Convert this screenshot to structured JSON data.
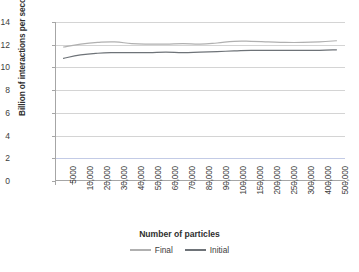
{
  "chart_data": {
    "type": "line",
    "title": "",
    "xlabel": "Number of particles",
    "ylabel": "Billion of interactions per second",
    "ylim": [
      0,
      14
    ],
    "yticks": [
      0,
      2,
      4,
      6,
      8,
      10,
      12,
      14
    ],
    "ytick_labels": [
      "0",
      "2",
      "4",
      "6",
      "8",
      "10",
      "12",
      "14"
    ],
    "grid": true,
    "legend_position": "bottom",
    "categories": [
      "5000",
      "10,000",
      "20,000",
      "30,000",
      "40,000",
      "50,000",
      "60,000",
      "70,000",
      "80,000",
      "90,000",
      "100,000",
      "150,000",
      "200,000",
      "250,000",
      "300,000",
      "400,000",
      "500,000"
    ],
    "series": [
      {
        "name": "Final",
        "color": "#b0b0b0",
        "values": [
          11.8,
          12.05,
          12.2,
          12.25,
          12.1,
          12.05,
          12.05,
          12.1,
          12.05,
          12.15,
          12.3,
          12.3,
          12.25,
          12.2,
          12.2,
          12.25,
          12.35
        ]
      },
      {
        "name": "Initial",
        "color": "#6e7378",
        "values": [
          10.8,
          11.1,
          11.25,
          11.3,
          11.3,
          11.3,
          11.35,
          11.3,
          11.35,
          11.4,
          11.45,
          11.5,
          11.5,
          11.5,
          11.5,
          11.5,
          11.55
        ]
      }
    ]
  },
  "axis": {
    "y_title": "Billion of interactions per second",
    "x_title": "Number of particles"
  },
  "colors": {
    "gridline": "#d4d4d4",
    "gridline_highlight": "#c3cbe6",
    "axis": "#a6a6a6",
    "series_final": "#b0b0b0",
    "series_initial": "#6e7378",
    "background": "#ffffff"
  }
}
